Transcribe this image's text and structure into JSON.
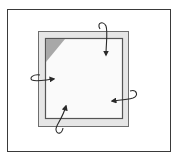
{
  "diagram": {
    "colors": {
      "frame_border": "#3a3a3a",
      "panel_fill": "#e6e6e6",
      "panel_border": "#6e6e6e",
      "inner_fill": "#fafafa",
      "inner_border": "#555555",
      "corner_triangle": "#a8a8a8",
      "arrow": "#2a2a2a"
    },
    "arrows": [
      {
        "side": "top",
        "direction": "down-into-panel"
      },
      {
        "side": "right",
        "direction": "left-into-panel"
      },
      {
        "side": "bottom",
        "direction": "up-into-panel"
      },
      {
        "side": "left",
        "direction": "right-into-panel"
      }
    ]
  }
}
